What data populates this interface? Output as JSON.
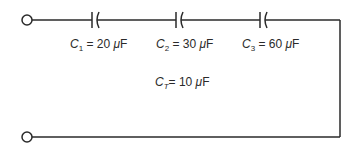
{
  "diagram": {
    "type": "series-capacitor-circuit",
    "colors": {
      "wire": "#2a2a2a",
      "background": "#ffffff"
    },
    "terminals": [
      {
        "id": "terminal-top",
        "cx": 27,
        "cy": 20
      },
      {
        "id": "terminal-bottom",
        "cx": 27,
        "cy": 137
      }
    ],
    "capacitors": [
      {
        "symbol": "C",
        "subscript": "1",
        "eq": " = ",
        "value": "20",
        "unit_prefix": "μ",
        "unit": "F",
        "x": 94
      },
      {
        "symbol": "C",
        "subscript": "2",
        "eq": " = ",
        "value": "30",
        "unit_prefix": "μ",
        "unit": "F",
        "x": 178
      },
      {
        "symbol": "C",
        "subscript": "3",
        "eq": " = ",
        "value": "60",
        "unit_prefix": "μ",
        "unit": "F",
        "x": 262
      }
    ],
    "total": {
      "symbol": "C",
      "subscript": "T",
      "eq": "= ",
      "value": "10",
      "unit_prefix": "μ",
      "unit": "F"
    }
  }
}
